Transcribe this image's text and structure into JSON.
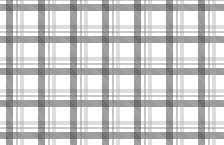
{
  "image": {
    "description": "Gray and white plaid / gingham fabric pattern",
    "pattern": "plaid",
    "colors": {
      "background": "#ffffff",
      "dark_band": "#3c3c3c",
      "mid_band": "#787878",
      "light_band": "#969696"
    },
    "repeat_px": 32
  }
}
